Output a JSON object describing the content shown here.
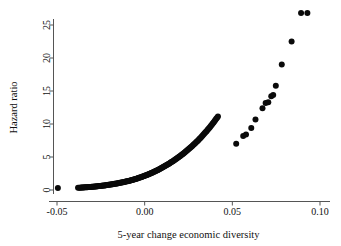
{
  "chart_data": {
    "type": "scatter",
    "title": "",
    "xlabel": "5-year change economic diversity",
    "ylabel": "Hazard ratio",
    "xlim": [
      -0.055,
      0.105
    ],
    "ylim": [
      -1.0,
      28.0
    ],
    "xticks": [
      -0.05,
      0.0,
      0.05,
      0.1
    ],
    "xticklabels": [
      "-0.05",
      "0.00",
      "0.05",
      "0.10"
    ],
    "yticks": [
      0,
      5,
      10,
      15,
      20,
      25
    ],
    "yticklabels": [
      "0",
      "5",
      "10",
      "15",
      "20",
      "25"
    ],
    "grid": false,
    "legend": null,
    "marker": {
      "shape": "circle",
      "color": "#0a0a0a",
      "size": 3.0
    },
    "series": [
      {
        "name": "Hazard ratio vs 5-year change in economic diversity",
        "x": [
          -0.0495,
          -0.038,
          -0.0373,
          -0.0367,
          -0.0362,
          -0.0357,
          -0.0352,
          -0.0347,
          -0.0342,
          -0.0337,
          -0.0332,
          -0.0327,
          -0.0322,
          -0.0317,
          -0.0312,
          -0.0307,
          -0.0302,
          -0.0297,
          -0.0292,
          -0.0287,
          -0.0282,
          -0.0277,
          -0.0272,
          -0.0267,
          -0.0262,
          -0.0257,
          -0.0252,
          -0.0247,
          -0.0242,
          -0.0237,
          -0.0232,
          -0.0227,
          -0.0222,
          -0.0217,
          -0.0212,
          -0.0207,
          -0.0202,
          -0.0197,
          -0.0192,
          -0.0187,
          -0.0182,
          -0.0177,
          -0.0172,
          -0.0167,
          -0.0162,
          -0.0157,
          -0.0152,
          -0.0147,
          -0.0142,
          -0.0137,
          -0.0132,
          -0.0127,
          -0.0122,
          -0.0117,
          -0.0112,
          -0.0107,
          -0.0102,
          -0.0097,
          -0.0092,
          -0.0087,
          -0.0082,
          -0.0077,
          -0.0072,
          -0.0067,
          -0.0062,
          -0.0057,
          -0.0052,
          -0.0047,
          -0.0042,
          -0.0037,
          -0.0032,
          -0.0027,
          -0.0022,
          -0.0017,
          -0.0012,
          -0.0007,
          -0.0002,
          0.0003,
          0.0008,
          0.0013,
          0.0018,
          0.0023,
          0.0028,
          0.0033,
          0.0038,
          0.0043,
          0.0048,
          0.0053,
          0.0058,
          0.0063,
          0.0068,
          0.0073,
          0.0078,
          0.0083,
          0.0088,
          0.0093,
          0.0098,
          0.0103,
          0.0108,
          0.0113,
          0.0118,
          0.0123,
          0.0128,
          0.0133,
          0.0138,
          0.0143,
          0.0148,
          0.0153,
          0.0158,
          0.0163,
          0.0168,
          0.0173,
          0.0178,
          0.0183,
          0.0188,
          0.0193,
          0.0198,
          0.0203,
          0.0208,
          0.0213,
          0.0218,
          0.0223,
          0.0228,
          0.0233,
          0.0238,
          0.0243,
          0.0248,
          0.0253,
          0.0258,
          0.0263,
          0.0268,
          0.0273,
          0.0278,
          0.0283,
          0.0288,
          0.0293,
          0.0298,
          0.0303,
          0.0308,
          0.0313,
          0.0318,
          0.0323,
          0.0328,
          0.0333,
          0.0338,
          0.0343,
          0.0348,
          0.0353,
          0.0358,
          0.0363,
          0.0368,
          0.0373,
          0.0378,
          0.0383,
          0.0388,
          0.0393,
          0.0398,
          0.0403,
          0.0408,
          0.0413,
          0.0418,
          0.0522,
          0.0562,
          0.0578,
          0.0608,
          0.0632,
          0.0672,
          0.069,
          0.0705,
          0.0722,
          0.0733,
          0.0748,
          0.0782,
          0.0838,
          0.0892,
          0.0928
        ],
        "y": [
          0.3,
          0.33,
          0.34,
          0.35,
          0.36,
          0.37,
          0.38,
          0.39,
          0.4,
          0.41,
          0.42,
          0.43,
          0.44,
          0.45,
          0.46,
          0.47,
          0.48,
          0.49,
          0.5,
          0.52,
          0.53,
          0.54,
          0.56,
          0.57,
          0.59,
          0.6,
          0.62,
          0.63,
          0.65,
          0.67,
          0.68,
          0.7,
          0.72,
          0.74,
          0.76,
          0.78,
          0.8,
          0.82,
          0.84,
          0.86,
          0.88,
          0.9,
          0.93,
          0.95,
          0.97,
          1.0,
          1.02,
          1.05,
          1.08,
          1.1,
          1.13,
          1.16,
          1.19,
          1.22,
          1.25,
          1.28,
          1.31,
          1.34,
          1.38,
          1.41,
          1.45,
          1.48,
          1.52,
          1.56,
          1.59,
          1.63,
          1.67,
          1.71,
          1.76,
          1.8,
          1.84,
          1.89,
          1.93,
          1.98,
          2.03,
          2.08,
          2.13,
          2.18,
          2.23,
          2.28,
          2.34,
          2.39,
          2.45,
          2.51,
          2.57,
          2.63,
          2.69,
          2.75,
          2.81,
          2.88,
          2.94,
          3.01,
          3.08,
          3.15,
          3.22,
          3.29,
          3.36,
          3.43,
          3.51,
          3.58,
          3.66,
          3.74,
          3.82,
          3.9,
          3.98,
          4.06,
          4.15,
          4.23,
          4.32,
          4.41,
          4.5,
          4.59,
          4.68,
          4.77,
          4.87,
          4.96,
          5.06,
          5.16,
          5.26,
          5.36,
          5.47,
          5.57,
          5.68,
          5.79,
          5.9,
          6.01,
          6.12,
          6.24,
          6.35,
          6.47,
          6.59,
          6.71,
          6.84,
          6.96,
          7.09,
          7.22,
          7.35,
          7.48,
          7.62,
          7.75,
          7.89,
          8.03,
          8.18,
          8.32,
          8.47,
          8.62,
          8.77,
          8.92,
          9.08,
          9.24,
          9.4,
          9.56,
          9.73,
          9.9,
          10.07,
          10.24,
          10.42,
          10.6,
          10.78,
          10.96,
          11.15,
          7.0,
          8.2,
          8.4,
          9.4,
          10.7,
          12.4,
          13.2,
          13.3,
          14.2,
          14.4,
          15.8,
          19.0,
          22.5,
          26.8,
          26.8
        ]
      }
    ],
    "note": "Dense lower curve is a monotone exponential-like ramp from HR 0.3 at x=-0.038 to HR 5 at x=0.042, plus one isolated point at x=-0.0495 (HR 0.3); upper region is a sparse set of discrete points from x=0.052 (HR 7) to x=0.093 (HR 26.8)."
  },
  "colors": {
    "marker": "#0a0a0a",
    "axis": "#555555",
    "text": "#111111",
    "background": "#ffffff"
  }
}
